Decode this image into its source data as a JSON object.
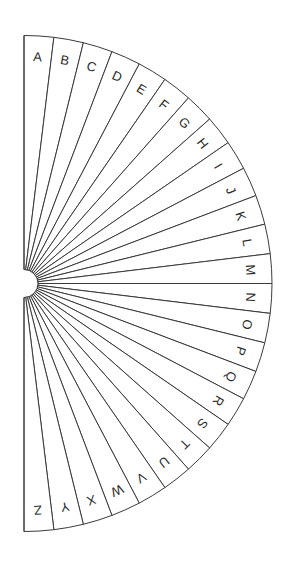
{
  "figure": {
    "background_color": "#ffffff",
    "line_color": "#3a3a3a",
    "text_color": "#2b2b2b",
    "fill_color": "#ffffff"
  },
  "geometry": {
    "center_x": 24,
    "center_y": 283.5,
    "outer_radius": 248,
    "hub_radius": 14,
    "start_angle_deg": -90,
    "end_angle_deg": 90,
    "sector_count": 26,
    "label_radius": 226
  },
  "chart_data": {
    "type": "pie",
    "xlabel": "",
    "ylabel": "",
    "legend_position": "none",
    "grid": false,
    "categories": [
      "A",
      "B",
      "C",
      "D",
      "E",
      "F",
      "G",
      "H",
      "I",
      "J",
      "K",
      "L",
      "M",
      "N",
      "O",
      "P",
      "Q",
      "R",
      "S",
      "T",
      "U",
      "V",
      "W",
      "X",
      "Y",
      "Z"
    ],
    "values": [
      1,
      1,
      1,
      1,
      1,
      1,
      1,
      1,
      1,
      1,
      1,
      1,
      1,
      1,
      1,
      1,
      1,
      1,
      1,
      1,
      1,
      1,
      1,
      1,
      1,
      1
    ],
    "total_sweep_deg": 180,
    "slice_sweep_deg": 6.923076923076923,
    "annotations": [
      "Each of the 26 equal sectors carries one alphabet letter near the outer arc."
    ]
  },
  "sectors": [
    {
      "label": "A",
      "index": 0
    },
    {
      "label": "B",
      "index": 1
    },
    {
      "label": "C",
      "index": 2
    },
    {
      "label": "D",
      "index": 3
    },
    {
      "label": "E",
      "index": 4
    },
    {
      "label": "F",
      "index": 5
    },
    {
      "label": "G",
      "index": 6
    },
    {
      "label": "H",
      "index": 7
    },
    {
      "label": "I",
      "index": 8
    },
    {
      "label": "J",
      "index": 9
    },
    {
      "label": "K",
      "index": 10
    },
    {
      "label": "L",
      "index": 11
    },
    {
      "label": "M",
      "index": 12
    },
    {
      "label": "N",
      "index": 13
    },
    {
      "label": "O",
      "index": 14
    },
    {
      "label": "P",
      "index": 15
    },
    {
      "label": "Q",
      "index": 16
    },
    {
      "label": "R",
      "index": 17
    },
    {
      "label": "S",
      "index": 18
    },
    {
      "label": "T",
      "index": 19
    },
    {
      "label": "U",
      "index": 20
    },
    {
      "label": "V",
      "index": 21
    },
    {
      "label": "W",
      "index": 22
    },
    {
      "label": "X",
      "index": 23
    },
    {
      "label": "Y",
      "index": 24
    },
    {
      "label": "Z",
      "index": 25
    }
  ]
}
